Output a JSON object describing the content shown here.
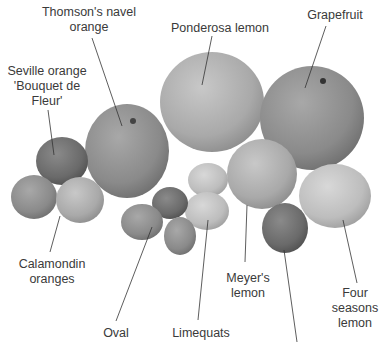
{
  "diagram": {
    "type": "labeled-photograph",
    "labels": [
      {
        "id": "thomson",
        "lines": [
          "Thomson's navel",
          "orange"
        ]
      },
      {
        "id": "ponderosa",
        "lines": [
          "Ponderosa lemon"
        ]
      },
      {
        "id": "grapefruit",
        "lines": [
          "Grapefruit"
        ]
      },
      {
        "id": "seville",
        "lines": [
          "Seville orange",
          "'Bouquet de",
          "Fleur'"
        ]
      },
      {
        "id": "calamondin",
        "lines": [
          "Calamondin",
          "oranges"
        ]
      },
      {
        "id": "meyer",
        "lines": [
          "Meyer's",
          "lemon"
        ]
      },
      {
        "id": "four-seasons",
        "lines": [
          "Four",
          "seasons",
          "lemon"
        ]
      },
      {
        "id": "oval",
        "lines": [
          "Oval"
        ]
      },
      {
        "id": "limequats",
        "lines": [
          "Limequats"
        ]
      }
    ]
  }
}
